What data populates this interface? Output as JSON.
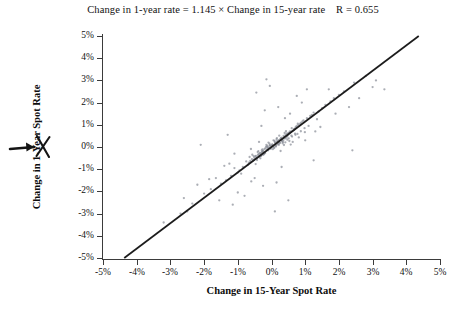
{
  "chart_data": {
    "type": "scatter",
    "title": "Change in 1-year rate = 1.145 × Change in 15-year rate    R = 0.655",
    "title_equation": "Change in 1-year rate = 1.145 × Change in 15-year rate",
    "title_r_text": "R = 0.655",
    "slope": 1.145,
    "intercept": 0,
    "r": 0.655,
    "xlabel": "Change in 15-Year Spot Rate",
    "ylabel": "Change in 1-Year Spot Rate",
    "xlim": [
      -5,
      5
    ],
    "ylim": [
      -5,
      5
    ],
    "grid": false,
    "legend": null,
    "xticks": [
      "-5%",
      "-4%",
      "-3%",
      "-2%",
      "-1%",
      "0%",
      "1%",
      "2%",
      "3%",
      "4%",
      "5%"
    ],
    "xtick_values": [
      -5,
      -4,
      -3,
      -2,
      -1,
      0,
      1,
      2,
      3,
      4,
      5
    ],
    "yticks": [
      "5%",
      "4%",
      "3%",
      "2%",
      "1%",
      "0%",
      "-1%",
      "-2%",
      "-3%",
      "-4%",
      "-5%"
    ],
    "ytick_values": [
      5,
      4,
      3,
      2,
      1,
      0,
      -1,
      -2,
      -3,
      -4,
      -5
    ],
    "point_color": "#8a8f99",
    "line_color": "#1c1c1c",
    "axis_color": "#3b3b3b",
    "regression_line": {
      "x_start": -4.37,
      "y_start": -5.0,
      "x_end": 4.37,
      "y_end": 5.0
    },
    "annotation": {
      "type": "handwritten-arrow",
      "target": "1-Year in y-axis label",
      "description": "hand-drawn arrow and cross-out mark pointing at the 1 in 1-Year"
    },
    "points": [
      [
        0.05,
        0.02
      ],
      [
        -0.1,
        -0.15
      ],
      [
        0.18,
        0.25
      ],
      [
        -0.22,
        -0.3
      ],
      [
        0.3,
        0.42
      ],
      [
        -0.05,
        0.08
      ],
      [
        0.12,
        0.05
      ],
      [
        -0.35,
        -0.4
      ],
      [
        0.45,
        0.6
      ],
      [
        -0.5,
        -0.55
      ],
      [
        0.08,
        -0.05
      ],
      [
        -0.15,
        0.1
      ],
      [
        0.25,
        0.18
      ],
      [
        -0.28,
        -0.22
      ],
      [
        0.55,
        0.7
      ],
      [
        0.02,
        0.12
      ],
      [
        -0.08,
        -0.02
      ],
      [
        0.35,
        0.3
      ],
      [
        -0.42,
        -0.48
      ],
      [
        0.6,
        0.85
      ],
      [
        0.15,
        0.35
      ],
      [
        -0.18,
        -0.05
      ],
      [
        0.22,
        0.1
      ],
      [
        -0.32,
        -0.38
      ],
      [
        0.48,
        0.52
      ],
      [
        0.0,
        0.0
      ],
      [
        -0.12,
        0.05
      ],
      [
        0.28,
        0.4
      ],
      [
        -0.25,
        -0.18
      ],
      [
        0.65,
        0.75
      ],
      [
        0.1,
        0.22
      ],
      [
        -0.2,
        -0.25
      ],
      [
        0.38,
        0.45
      ],
      [
        -0.45,
        -0.5
      ],
      [
        0.72,
        0.9
      ],
      [
        0.04,
        -0.1
      ],
      [
        -0.06,
        0.15
      ],
      [
        0.32,
        0.28
      ],
      [
        -0.38,
        -0.32
      ],
      [
        0.52,
        0.65
      ],
      [
        0.2,
        0.15
      ],
      [
        -0.14,
        -0.12
      ],
      [
        0.42,
        0.55
      ],
      [
        -0.55,
        -0.62
      ],
      [
        0.8,
        1.0
      ],
      [
        0.06,
        0.3
      ],
      [
        -0.02,
        -0.08
      ],
      [
        0.26,
        0.35
      ],
      [
        -0.3,
        -0.26
      ],
      [
        0.58,
        0.68
      ],
      [
        0.14,
        0.08
      ],
      [
        -0.24,
        -0.35
      ],
      [
        0.46,
        0.48
      ],
      [
        -0.48,
        -0.42
      ],
      [
        0.88,
        1.1
      ],
      [
        0.01,
        0.05
      ],
      [
        -0.16,
        0.02
      ],
      [
        0.34,
        0.22
      ],
      [
        -0.36,
        -0.45
      ],
      [
        0.68,
        0.8
      ],
      [
        0.11,
        0.18
      ],
      [
        -0.21,
        -0.1
      ],
      [
        0.4,
        0.38
      ],
      [
        -0.52,
        -0.58
      ],
      [
        0.95,
        1.2
      ],
      [
        0.07,
        -0.02
      ],
      [
        -0.09,
        0.2
      ],
      [
        0.29,
        0.32
      ],
      [
        -0.34,
        -0.28
      ],
      [
        0.62,
        0.72
      ],
      [
        0.17,
        0.25
      ],
      [
        -0.26,
        -0.2
      ],
      [
        0.5,
        0.58
      ],
      [
        -0.6,
        -0.68
      ],
      [
        1.05,
        1.3
      ],
      [
        0.03,
        0.1
      ],
      [
        -0.11,
        -0.05
      ],
      [
        0.24,
        0.2
      ],
      [
        -0.4,
        -0.36
      ],
      [
        0.75,
        0.95
      ],
      [
        0.13,
        0.02
      ],
      [
        -0.19,
        -0.28
      ],
      [
        0.44,
        0.42
      ],
      [
        -0.44,
        -0.52
      ],
      [
        1.15,
        1.4
      ],
      [
        0.09,
        0.28
      ],
      [
        -0.04,
        0.06
      ],
      [
        0.36,
        0.5
      ],
      [
        -0.29,
        -0.15
      ],
      [
        0.85,
        1.05
      ],
      [
        0.19,
        0.12
      ],
      [
        -0.23,
        -0.32
      ],
      [
        0.54,
        0.62
      ],
      [
        -0.58,
        -0.55
      ],
      [
        1.25,
        1.55
      ],
      [
        0.16,
        0.4
      ],
      [
        -0.13,
        0.0
      ],
      [
        0.31,
        0.26
      ],
      [
        -0.46,
        -0.4
      ],
      [
        0.92,
        1.15
      ],
      [
        -0.7,
        -0.8
      ],
      [
        0.7,
        0.6
      ],
      [
        -0.75,
        -0.65
      ],
      [
        1.4,
        1.6
      ],
      [
        -1.0,
        -1.15
      ],
      [
        0.78,
        1.05
      ],
      [
        -0.85,
        -0.9
      ],
      [
        1.5,
        1.75
      ],
      [
        -1.2,
        -1.3
      ],
      [
        0.98,
        0.85
      ],
      [
        -0.95,
        -1.05
      ],
      [
        1.6,
        1.9
      ],
      [
        -1.35,
        -1.5
      ],
      [
        1.1,
        0.95
      ],
      [
        -1.1,
        -0.95
      ],
      [
        1.75,
        2.05
      ],
      [
        -1.5,
        -1.65
      ],
      [
        1.2,
        1.45
      ],
      [
        -0.65,
        -0.45
      ],
      [
        1.85,
        2.2
      ],
      [
        -1.65,
        -1.4
      ],
      [
        1.35,
        1.25
      ],
      [
        -0.9,
        -1.2
      ],
      [
        2.0,
        2.35
      ],
      [
        -1.8,
        -1.9
      ],
      [
        0.4,
        1.3
      ],
      [
        -0.5,
        -1.4
      ],
      [
        1.0,
        0.3
      ],
      [
        -1.1,
        -0.3
      ],
      [
        0.3,
        -0.9
      ],
      [
        -0.3,
        0.95
      ],
      [
        1.3,
        0.7
      ],
      [
        -1.25,
        -0.75
      ],
      [
        0.55,
        1.5
      ],
      [
        -0.6,
        -1.55
      ],
      [
        2.15,
        2.5
      ],
      [
        -2.0,
        -2.1
      ],
      [
        0.9,
        2.0
      ],
      [
        -1.0,
        -2.05
      ],
      [
        2.3,
        1.8
      ],
      [
        -2.2,
        -1.7
      ],
      [
        1.7,
        2.6
      ],
      [
        -1.55,
        -2.4
      ],
      [
        0.2,
        1.8
      ],
      [
        -0.25,
        -1.75
      ],
      [
        2.45,
        2.9
      ],
      [
        -2.35,
        -2.55
      ],
      [
        1.45,
        0.9
      ],
      [
        -1.4,
        -0.85
      ],
      [
        0.75,
        2.3
      ],
      [
        -0.8,
        -2.2
      ],
      [
        2.6,
        2.2
      ],
      [
        -2.5,
        -2.9
      ],
      [
        0.15,
        -1.6
      ],
      [
        -0.2,
        1.65
      ],
      [
        3.0,
        2.7
      ],
      [
        -2.7,
        -3.0
      ],
      [
        1.9,
        1.5
      ],
      [
        -1.85,
        -1.45
      ],
      [
        0.5,
        -2.4
      ],
      [
        -0.45,
        2.45
      ],
      [
        2.8,
        3.2
      ],
      [
        -2.6,
        -2.3
      ],
      [
        1.05,
        2.6
      ],
      [
        -1.15,
        -2.6
      ],
      [
        0.33,
        0.17
      ],
      [
        -0.27,
        -0.11
      ],
      [
        0.47,
        0.33
      ],
      [
        -0.41,
        -0.23
      ],
      [
        0.61,
        0.47
      ],
      [
        0.21,
        0.31
      ],
      [
        -0.31,
        -0.41
      ],
      [
        0.51,
        0.39
      ],
      [
        -0.51,
        -0.47
      ],
      [
        0.71,
        0.55
      ],
      [
        0.27,
        -0.18
      ],
      [
        -0.37,
        0.23
      ],
      [
        0.57,
        0.11
      ],
      [
        -0.61,
        -0.09
      ],
      [
        0.81,
        0.43
      ],
      [
        0.39,
        0.63
      ],
      [
        -0.43,
        -0.59
      ],
      [
        0.67,
        0.79
      ],
      [
        -0.67,
        -0.71
      ],
      [
        0.99,
        0.67
      ],
      [
        0.23,
        0.51
      ],
      [
        -0.33,
        -0.51
      ],
      [
        0.43,
        0.71
      ],
      [
        -0.47,
        -0.77
      ],
      [
        0.63,
        0.23
      ],
      [
        0.37,
        0.09
      ],
      [
        -0.39,
        -0.19
      ],
      [
        0.53,
        0.27
      ],
      [
        -0.57,
        -0.35
      ],
      [
        0.77,
        0.59
      ],
      [
        0.31,
        0.37
      ],
      [
        -0.35,
        -0.29
      ],
      [
        0.59,
        0.51
      ],
      [
        -0.63,
        -0.63
      ],
      [
        0.87,
        0.71
      ],
      [
        0.41,
        0.21
      ],
      [
        -0.29,
        -0.37
      ],
      [
        0.49,
        0.61
      ],
      [
        -0.53,
        -0.41
      ],
      [
        0.69,
        0.83
      ],
      [
        -3.2,
        -3.4
      ],
      [
        3.1,
        3.0
      ],
      [
        -0.05,
        2.75
      ],
      [
        2.4,
        -0.15
      ],
      [
        -2.1,
        0.1
      ],
      [
        1.25,
        -0.6
      ],
      [
        -1.3,
        0.55
      ],
      [
        0.1,
        -2.9
      ],
      [
        -0.15,
        3.05
      ],
      [
        3.35,
        2.6
      ]
    ]
  }
}
